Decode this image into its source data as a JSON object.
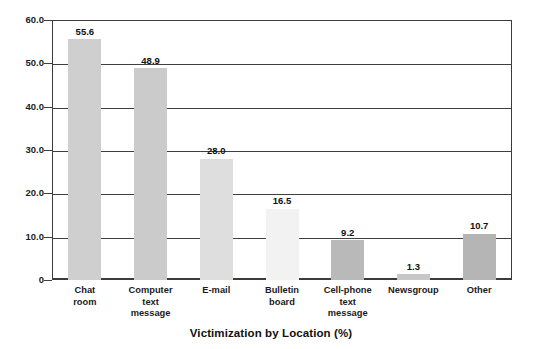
{
  "chart_data": {
    "type": "bar",
    "title": "Victimization by Location (%)",
    "xlabel": "",
    "ylabel": "",
    "ylim": [
      0,
      60
    ],
    "yticks": [
      "0",
      "10.0",
      "20.0",
      "30.0",
      "40.0",
      "50.0",
      "60.0"
    ],
    "ytick_values": [
      0,
      10,
      20,
      30,
      40,
      50,
      60
    ],
    "grid": true,
    "legend": "none",
    "categories": [
      "Chat\nroom",
      "Computer\ntext\nmessage",
      "E-mail",
      "Bulletin\nboard",
      "Cell-phone\ntext\nmessage",
      "Newsgroup",
      "Other"
    ],
    "values": [
      55.6,
      48.9,
      28.0,
      16.5,
      9.2,
      1.3,
      10.7
    ],
    "value_labels": [
      "55.6",
      "48.9",
      "28.0",
      "16.5",
      "9.2",
      "1.3",
      "10.7"
    ],
    "bar_colors": [
      "#cfcfcf",
      "#cbcbcb",
      "#dedede",
      "#f2f2f2",
      "#b9b9b9",
      "#c7c7c7",
      "#b5b5b5"
    ],
    "axis_color": "#3f3f3f",
    "text_color": "#111111"
  }
}
